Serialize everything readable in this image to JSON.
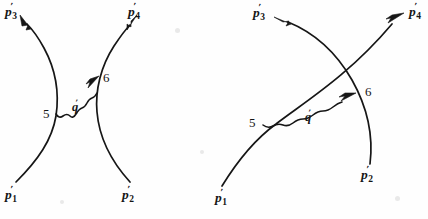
{
  "figure": {
    "ink_color": "#161616",
    "background_color": "#fefefe",
    "panels": [
      {
        "id": "left-panel",
        "name": "uncrossed-diagram",
        "labels": {
          "p1": {
            "base": "p",
            "prime": "′",
            "sub": "1"
          },
          "p2": {
            "base": "p",
            "prime": "′",
            "sub": "2"
          },
          "p3": {
            "base": "p",
            "prime": "′",
            "sub": "3"
          },
          "p4": {
            "base": "p",
            "prime": "′",
            "sub": "4"
          },
          "vertex_left": "5",
          "vertex_right": "6",
          "exchange": {
            "base": "q",
            "prime": "′"
          }
        }
      },
      {
        "id": "right-panel",
        "name": "crossed-diagram",
        "labels": {
          "p1": {
            "base": "p",
            "prime": "′",
            "sub": "1"
          },
          "p2": {
            "base": "p",
            "prime": "′",
            "sub": "2"
          },
          "p3": {
            "base": "p",
            "prime": "′",
            "sub": "3"
          },
          "p4": {
            "base": "p",
            "prime": "′",
            "sub": "4"
          },
          "vertex_left": "5",
          "vertex_right": "6",
          "exchange": {
            "base": "q",
            "prime": "′"
          }
        }
      }
    ]
  }
}
